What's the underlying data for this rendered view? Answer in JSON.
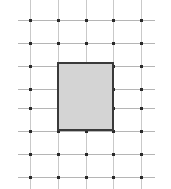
{
  "figure": {
    "canvas": {
      "width": 171,
      "height": 189,
      "background_color": "#ffffff"
    },
    "grid": {
      "line_color_vertical": "#c9c9c9",
      "line_color_horizontal": "#b5b5b5",
      "node_color": "#2b2b2b",
      "node_size": 3,
      "column_count": 5,
      "row_count": 8,
      "column_x": [
        30,
        58,
        86,
        113,
        141
      ],
      "row_y": [
        20,
        43,
        66,
        89,
        108,
        131,
        154,
        177
      ],
      "vertical_line_top": 0,
      "vertical_line_bottom": 189,
      "horizontal_line_left": 18,
      "horizontal_line_right": 155
    },
    "shape": {
      "type": "rectangle",
      "fill_color": "#d4d4d4",
      "border_color": "#3a3a3a",
      "border_width": 2,
      "left": 57,
      "top": 62,
      "width": 57,
      "height": 69
    }
  }
}
